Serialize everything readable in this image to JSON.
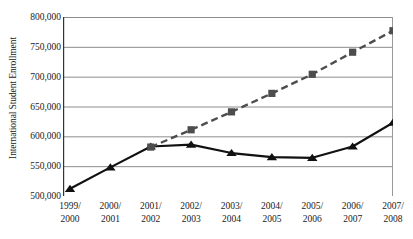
{
  "chart_data": {
    "type": "line",
    "title": "",
    "xlabel": "",
    "ylabel": "International Student Enrollment",
    "categories": [
      "1999/\n2000",
      "2000/\n2001",
      "2001/\n2002",
      "2002/\n2003",
      "2003/\n2004",
      "2004/\n2005",
      "2005/\n2006",
      "2006/\n2007",
      "2007/\n2008"
    ],
    "category_lines": [
      [
        "1999/",
        "2000"
      ],
      [
        "2000/",
        "2001"
      ],
      [
        "2001/",
        "2002"
      ],
      [
        "2002/",
        "2003"
      ],
      [
        "2003/",
        "2004"
      ],
      [
        "2004/",
        "2005"
      ],
      [
        "2005/",
        "2006"
      ],
      [
        "2006/",
        "2007"
      ],
      [
        "2007/",
        "2008"
      ]
    ],
    "ylim": [
      500000,
      800000
    ],
    "ytick_values": [
      800000,
      750000,
      700000,
      650000,
      600000,
      550000,
      500000
    ],
    "ytick_labels": [
      "800,000",
      "750,000",
      "700,000",
      "650,000",
      "600,000",
      "550,000",
      "500,000"
    ],
    "grid": true,
    "legend": "none",
    "series": [
      {
        "name": "actual-enrollment",
        "style": "solid",
        "marker": "triangle",
        "color": "#111111",
        "values": [
          512000,
          548000,
          583000,
          586000,
          572000,
          565000,
          564000,
          583000,
          623000
        ]
      },
      {
        "name": "projected-trend",
        "style": "dashed",
        "marker": "square",
        "color": "#4d4d4d",
        "values": [
          null,
          null,
          582000,
          611000,
          641000,
          672000,
          704000,
          741000,
          777000
        ]
      }
    ]
  },
  "axis": {
    "y_title": "International Student Enrollment"
  },
  "colors": {
    "gridline": "#8c8c8c",
    "axis": "#4d4d4d",
    "solid_series": "#111111",
    "dashed_series": "#4d4d4d",
    "background": "#ffffff"
  }
}
